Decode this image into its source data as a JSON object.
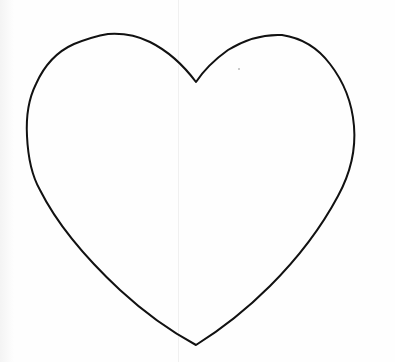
{
  "image": {
    "subject": "hand-drawn heart outline",
    "width": 395,
    "height": 362,
    "background_color": "#fefefe",
    "stroke_color": "#111111",
    "fold_line_color": "#f0f0f0"
  },
  "heart": {
    "notch": [
      196,
      82
    ],
    "left_lobe_top": [
      110,
      34
    ],
    "right_lobe_top": [
      278,
      35
    ],
    "left_extreme": [
      27,
      130
    ],
    "right_extreme": [
      354,
      130
    ],
    "bottom_tip": [
      196,
      345
    ]
  }
}
